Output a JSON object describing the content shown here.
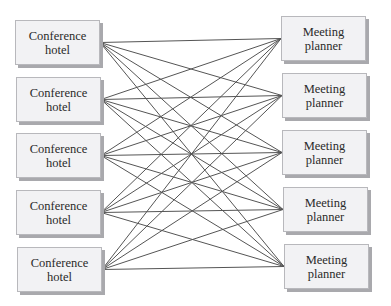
{
  "diagram": {
    "type": "complete-bipartite-network",
    "left_nodes": [
      {
        "line1": "Conference",
        "line2": "hotel"
      },
      {
        "line1": "Conference",
        "line2": "hotel"
      },
      {
        "line1": "Conference",
        "line2": "hotel"
      },
      {
        "line1": "Conference",
        "line2": "hotel"
      },
      {
        "line1": "Conference",
        "line2": "hotel"
      }
    ],
    "right_nodes": [
      {
        "line1": "Meeting",
        "line2": "planner"
      },
      {
        "line1": "Meeting",
        "line2": "planner"
      },
      {
        "line1": "Meeting",
        "line2": "planner"
      },
      {
        "line1": "Meeting",
        "line2": "planner"
      },
      {
        "line1": "Meeting",
        "line2": "planner"
      }
    ],
    "connections": "every left node connects to every right node",
    "edge_count": 25,
    "colors": {
      "box_fill": "#f2f2f4",
      "box_border": "#b8b8bc",
      "shadow": "#a9a9ad",
      "edge": "#555555",
      "text": "#2a2a2a"
    }
  }
}
